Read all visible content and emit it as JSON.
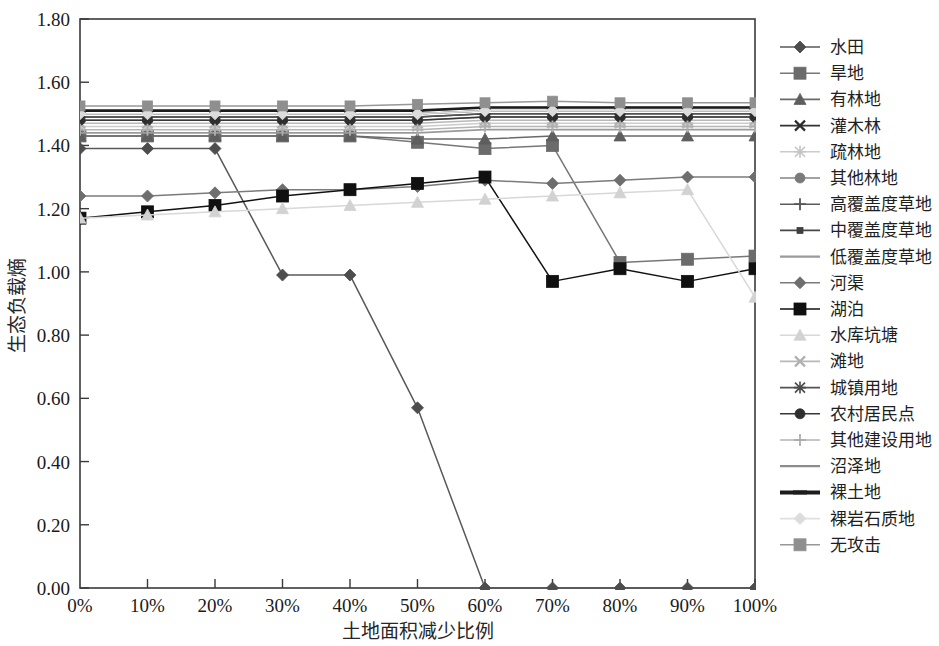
{
  "chart_data": {
    "type": "line",
    "title": "",
    "xlabel": "土地面积减少比例",
    "ylabel": "生态负载熵",
    "x": [
      "0%",
      "10%",
      "20%",
      "30%",
      "40%",
      "50%",
      "60%",
      "70%",
      "80%",
      "90%",
      "100%"
    ],
    "xlim": [
      0,
      10
    ],
    "ylim": [
      0.0,
      1.8
    ],
    "ytick_labels": [
      "0.00",
      "0.20",
      "0.40",
      "0.60",
      "0.80",
      "1.00",
      "1.20",
      "1.40",
      "1.60",
      "1.80"
    ],
    "ytick_values": [
      0.0,
      0.2,
      0.4,
      0.6,
      0.8,
      1.0,
      1.2,
      1.4,
      1.6,
      1.8
    ],
    "grid": false,
    "legend_position": "right",
    "series": [
      {
        "name": "水田",
        "marker": "diamond",
        "color": "#4d4d4d",
        "line_color": "#595959",
        "values": [
          1.39,
          1.39,
          1.39,
          0.99,
          0.99,
          0.57,
          0.0,
          0.0,
          0.0,
          0.0,
          0.0
        ]
      },
      {
        "name": "旱地",
        "marker": "square",
        "color": "#6b6b6b",
        "line_color": "#777777",
        "values": [
          1.43,
          1.43,
          1.43,
          1.43,
          1.43,
          1.41,
          1.39,
          1.4,
          1.03,
          1.04,
          1.05
        ]
      },
      {
        "name": "有林地",
        "marker": "triangle",
        "color": "#5e5e5e",
        "line_color": "#6a6a6a",
        "values": [
          1.43,
          1.43,
          1.43,
          1.43,
          1.43,
          1.42,
          1.42,
          1.43,
          1.43,
          1.43,
          1.43
        ]
      },
      {
        "name": "灌木林",
        "marker": "x",
        "color": "#2b2b2b",
        "line_color": "#333333",
        "values": [
          1.49,
          1.49,
          1.49,
          1.49,
          1.49,
          1.49,
          1.5,
          1.5,
          1.5,
          1.5,
          1.5
        ]
      },
      {
        "name": "疏林地",
        "marker": "star",
        "color": "#c4c4c4",
        "line_color": "#cccccc",
        "values": [
          1.46,
          1.46,
          1.46,
          1.46,
          1.46,
          1.46,
          1.47,
          1.47,
          1.47,
          1.47,
          1.47
        ]
      },
      {
        "name": "其他林地",
        "marker": "circle",
        "color": "#7a7a7a",
        "line_color": "#848484",
        "values": [
          1.48,
          1.48,
          1.48,
          1.48,
          1.48,
          1.48,
          1.49,
          1.49,
          1.49,
          1.49,
          1.49
        ]
      },
      {
        "name": "高覆盖度草地",
        "marker": "plus",
        "color": "#555555",
        "line_color": "#5d5d5d",
        "values": [
          1.51,
          1.51,
          1.51,
          1.51,
          1.51,
          1.51,
          1.52,
          1.52,
          1.52,
          1.52,
          1.52
        ]
      },
      {
        "name": "中覆盖度草地",
        "marker": "smallsquare",
        "color": "#3f3f3f",
        "line_color": "#474747",
        "values": [
          1.5,
          1.5,
          1.5,
          1.5,
          1.5,
          1.5,
          1.51,
          1.51,
          1.51,
          1.51,
          1.51
        ]
      },
      {
        "name": "低覆盖度草地",
        "marker": "none",
        "color": "#9a9a9a",
        "line_color": "#9a9a9a",
        "values": [
          1.44,
          1.44,
          1.44,
          1.44,
          1.44,
          1.44,
          1.45,
          1.45,
          1.45,
          1.45,
          1.45
        ]
      },
      {
        "name": "河渠",
        "marker": "diamond",
        "color": "#6e6e6e",
        "line_color": "#7b7b7b",
        "values": [
          1.24,
          1.24,
          1.25,
          1.26,
          1.26,
          1.27,
          1.29,
          1.28,
          1.29,
          1.3,
          1.3
        ]
      },
      {
        "name": "湖泊",
        "marker": "square",
        "color": "#101010",
        "line_color": "#111111",
        "values": [
          1.17,
          1.19,
          1.21,
          1.24,
          1.26,
          1.28,
          1.3,
          0.97,
          1.01,
          0.97,
          1.01
        ]
      },
      {
        "name": "水库坑塘",
        "marker": "triangle",
        "color": "#d2d2d2",
        "line_color": "#d8d8d8",
        "values": [
          1.17,
          1.18,
          1.19,
          1.2,
          1.21,
          1.22,
          1.23,
          1.24,
          1.25,
          1.26,
          0.92
        ]
      },
      {
        "name": "滩地",
        "marker": "x",
        "color": "#b0b0b0",
        "line_color": "#b8b8b8",
        "values": [
          1.47,
          1.47,
          1.47,
          1.47,
          1.47,
          1.47,
          1.48,
          1.48,
          1.48,
          1.48,
          1.48
        ]
      },
      {
        "name": "城镇用地",
        "marker": "star",
        "color": "#4a4a4a",
        "line_color": "#545454",
        "values": [
          1.49,
          1.49,
          1.49,
          1.49,
          1.49,
          1.49,
          1.5,
          1.5,
          1.5,
          1.5,
          1.5
        ]
      },
      {
        "name": "农村居民点",
        "marker": "circle",
        "color": "#2f2f2f",
        "line_color": "#383838",
        "values": [
          1.48,
          1.48,
          1.48,
          1.48,
          1.48,
          1.48,
          1.49,
          1.49,
          1.49,
          1.49,
          1.49
        ]
      },
      {
        "name": "其他建设用地",
        "marker": "plus",
        "color": "#aeaeae",
        "line_color": "#b5b5b5",
        "values": [
          1.45,
          1.45,
          1.45,
          1.45,
          1.45,
          1.45,
          1.46,
          1.46,
          1.46,
          1.46,
          1.46
        ]
      },
      {
        "name": "沼泽地",
        "marker": "none",
        "color": "#8c8c8c",
        "line_color": "#8c8c8c",
        "values": [
          1.5,
          1.5,
          1.5,
          1.5,
          1.5,
          1.5,
          1.51,
          1.51,
          1.51,
          1.51,
          1.51
        ]
      },
      {
        "name": "裸土地",
        "marker": "thickline",
        "color": "#1c1c1c",
        "line_color": "#1c1c1c",
        "values": [
          1.51,
          1.51,
          1.51,
          1.51,
          1.51,
          1.51,
          1.52,
          1.52,
          1.52,
          1.52,
          1.52
        ]
      },
      {
        "name": "裸岩石质地",
        "marker": "diamond",
        "color": "#dcdcdc",
        "line_color": "#e0e0e0",
        "values": [
          1.5,
          1.5,
          1.5,
          1.5,
          1.5,
          1.5,
          1.51,
          1.51,
          1.51,
          1.51,
          1.51
        ]
      },
      {
        "name": "无攻击",
        "marker": "square",
        "color": "#8f8f8f",
        "line_color": "#989898",
        "values": [
          1.525,
          1.525,
          1.525,
          1.525,
          1.525,
          1.53,
          1.535,
          1.54,
          1.535,
          1.535,
          1.535
        ]
      }
    ]
  },
  "axes": {
    "y_title": "生态负载熵",
    "x_title": "土地面积减少比例"
  }
}
